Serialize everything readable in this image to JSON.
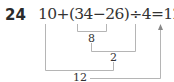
{
  "problem": {
    "number": "24",
    "expression": "10+(34−26)÷4=12",
    "steps": [
      {
        "label": "8",
        "from": "34−26"
      },
      {
        "label": "2",
        "from": "8÷4"
      },
      {
        "label": "12",
        "from": "10+2"
      }
    ]
  },
  "colors": {
    "line": "#b5b5b5",
    "text": "#333333"
  }
}
